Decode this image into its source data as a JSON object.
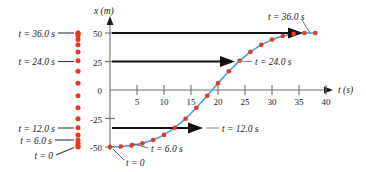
{
  "figure": {
    "title": "",
    "background_color": "#ffffff",
    "axis_color": "#6e6e6e",
    "curve_color": "#3aa8d8",
    "dot_color": "#e8381f",
    "arrow_color": "#111111",
    "leader_color": "#808080"
  },
  "axes": {
    "x_axis_label": "t (s)",
    "y_axis_label": "x (m)",
    "x_ticks": [
      "5",
      "10",
      "15",
      "20",
      "25",
      "30",
      "35",
      "40"
    ],
    "x_tick_values": [
      5,
      10,
      15,
      20,
      25,
      30,
      35,
      40
    ],
    "y_ticks": [
      "50",
      "25",
      "0",
      "-25",
      "-50"
    ],
    "y_tick_values": [
      50,
      25,
      0,
      -25,
      -50
    ],
    "xlim": [
      0,
      42
    ],
    "ylim": [
      -57,
      57
    ],
    "grid": false
  },
  "chart_data": {
    "type": "scatter",
    "title": "",
    "xlabel": "t (s)",
    "ylabel": "x (m)",
    "xlim": [
      0,
      42
    ],
    "ylim": [
      -57,
      57
    ],
    "grid": false,
    "series": [
      {
        "name": "position-vs-time",
        "marker": "circle",
        "color": "#e8381f",
        "line_color": "#3aa8d8",
        "x": [
          0,
          2,
          4,
          6,
          8,
          10,
          12,
          14,
          16,
          18,
          20,
          22,
          24,
          26,
          28,
          30,
          32,
          34,
          36,
          38
        ],
        "y": [
          -50.0,
          -49.6,
          -48.6,
          -46.8,
          -43.8,
          -39.4,
          -33.2,
          -25.2,
          -15.6,
          -5.0,
          6.0,
          16.4,
          25.6,
          33.4,
          39.6,
          44.2,
          47.4,
          49.2,
          50.0,
          50.0
        ]
      }
    ],
    "motion_diagram": {
      "name": "vertical-position-strip",
      "description": "column of red dots showing x positions at successive equal time intervals",
      "x_pixel_strip": true,
      "y": [
        -50.0,
        -49.6,
        -48.6,
        -46.8,
        -43.8,
        -39.4,
        -33.2,
        -25.2,
        -15.6,
        -5.0,
        6.0,
        16.4,
        25.6,
        33.4,
        39.6,
        44.2,
        47.4,
        49.2,
        50.0,
        50.0
      ]
    }
  },
  "annotations": {
    "left_labels": [
      {
        "text": "t = 36.0 s",
        "y_value": 50.0
      },
      {
        "text": "t = 24.0 s",
        "y_value": 25.6
      },
      {
        "text": "t = 12.0 s",
        "y_value": -33.2
      },
      {
        "text": "t = 6.0 s",
        "y_value": -46.8
      },
      {
        "text": "t = 0",
        "y_value": -50.0
      }
    ],
    "curve_labels": [
      {
        "text": "t = 36.0 s"
      },
      {
        "text": "t = 24.0 s"
      },
      {
        "text": "t = 12.0 s"
      },
      {
        "text": "t = 6.0 s"
      },
      {
        "text": "t = 0"
      }
    ],
    "arrows": [
      {
        "name": "arrow-36",
        "y_value": 50.0,
        "from_t": 0,
        "to_t": 36
      },
      {
        "name": "arrow-24",
        "y_value": 25.6,
        "from_t": 0,
        "to_t": 24
      },
      {
        "name": "arrow-12",
        "y_value": -33.2,
        "from_t": 0,
        "to_t": 12
      }
    ]
  }
}
